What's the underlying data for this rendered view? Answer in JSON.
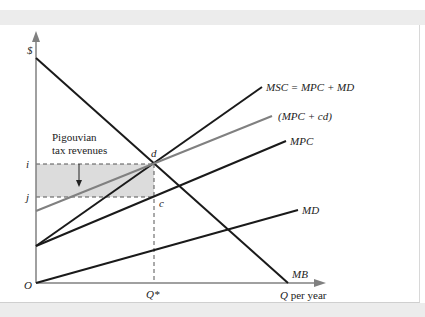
{
  "figure": {
    "axes": {
      "y_label": "$",
      "x_label_italic": "Q",
      "x_label_rest": " per year",
      "origin_label": "O",
      "y_ticks": [
        {
          "label": "i",
          "y": 164
        },
        {
          "label": "j",
          "y": 197
        }
      ],
      "x_ticks": [
        {
          "label": "Q*",
          "x": 154
        }
      ]
    },
    "curves": [
      {
        "name": "MSC = MPC + MD",
        "color": "#1a1a1a"
      },
      {
        "name": "(MPC + cd)",
        "color": "#808080"
      },
      {
        "name": "MPC",
        "color": "#1a1a1a"
      },
      {
        "name": "MD",
        "color": "#1a1a1a"
      },
      {
        "name": "MB",
        "color": "#1a1a1a"
      }
    ],
    "points": [
      {
        "label": "d"
      },
      {
        "label": "c"
      }
    ],
    "annotation": {
      "line1": "Pigouvian",
      "line2": "tax revenues"
    },
    "shaded_region_color": "#dcdcdc"
  }
}
